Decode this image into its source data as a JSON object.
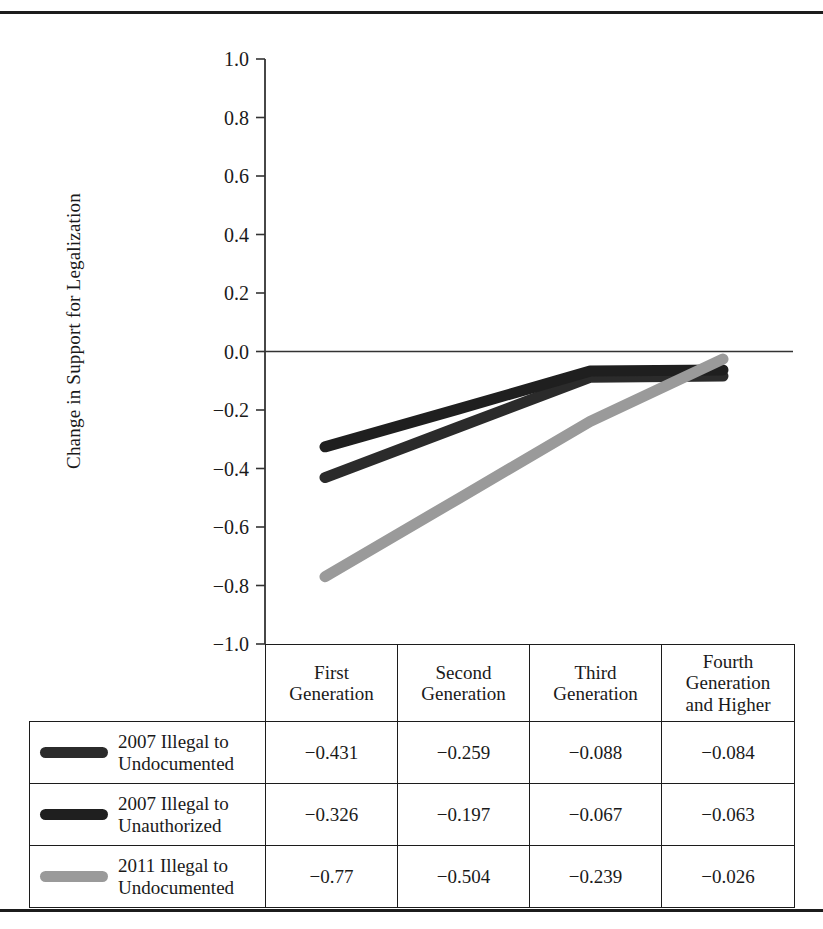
{
  "chart_data": {
    "type": "line",
    "title": "",
    "xlabel": "",
    "ylabel": "Change in Support for Legalization",
    "ylim": [
      -1.0,
      1.0
    ],
    "ytick_labels": [
      "1.0",
      "0.8",
      "0.6",
      "0.4",
      "0.2",
      "0.0",
      "−0.2",
      "−0.4",
      "−0.6",
      "−0.8",
      "−1.0"
    ],
    "ytick_values": [
      1.0,
      0.8,
      0.6,
      0.4,
      0.2,
      0.0,
      -0.2,
      -0.4,
      -0.6,
      -0.8,
      -1.0
    ],
    "grid": false,
    "legend_position": "table-below",
    "zero_line": true,
    "categories": [
      "First Generation",
      "Second Generation",
      "Third Generation",
      "Fourth Generation and Higher"
    ],
    "series": [
      {
        "name": "2007 Illegal to Undocumented",
        "color": "#2b2b2b",
        "values": [
          -0.431,
          -0.259,
          -0.088,
          -0.084
        ],
        "labels": [
          "−0.431",
          "−0.259",
          "−0.088",
          "−0.084"
        ]
      },
      {
        "name": "2007 Illegal to Unauthorized",
        "color": "#1f1f1f",
        "values": [
          -0.326,
          -0.197,
          -0.067,
          -0.063
        ],
        "labels": [
          "−0.326",
          "−0.197",
          "−0.067",
          "−0.063"
        ]
      },
      {
        "name": "2011 Illegal to Undocumented",
        "color": "#9a9a9a",
        "values": [
          -0.77,
          -0.504,
          -0.239,
          -0.026
        ],
        "labels": [
          "−0.77",
          "−0.504",
          "−0.239",
          "−0.026"
        ]
      }
    ]
  },
  "table": {
    "corner_label": "",
    "column_headers": [
      "First\nGeneration",
      "Second\nGeneration",
      "Third\nGeneration",
      "Fourth\nGeneration\nand Higher"
    ],
    "rows": [
      {
        "legend_line1": "2007 Illegal to",
        "legend_line2": "Undocumented",
        "swatch_color": "#2b2b2b",
        "cells": [
          "−0.431",
          "−0.259",
          "−0.088",
          "−0.084"
        ]
      },
      {
        "legend_line1": "2007 Illegal to",
        "legend_line2": "Unauthorized",
        "swatch_color": "#1f1f1f",
        "cells": [
          "−0.326",
          "−0.197",
          "−0.067",
          "−0.063"
        ]
      },
      {
        "legend_line1": "2011 Illegal to",
        "legend_line2": "Undocumented",
        "swatch_color": "#9a9a9a",
        "cells": [
          "−0.77",
          "−0.504",
          "−0.239",
          "−0.026"
        ]
      }
    ]
  }
}
